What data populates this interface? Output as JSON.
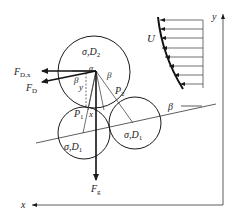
{
  "diagram": {
    "labels": {
      "top_particle": "σ,D",
      "top_particle_sub": "2",
      "bottom_left_particle": "σ,D",
      "bottom_left_particle_sub": "1",
      "bottom_right_particle": "σ,D",
      "bottom_right_particle_sub": "1",
      "drag_x": "F",
      "drag_x_sub": "D,x",
      "drag": "F",
      "drag_sub": "D",
      "gravity": "F",
      "gravity_sub": "g",
      "pivot_1": "P",
      "pivot_1_sub": "1",
      "pivot_2": "P",
      "pivot_2_sub": "2",
      "angle_beta_left": "β",
      "angle_beta_right": "β",
      "angle_beta_slope": "β",
      "angle_alpha": "α",
      "dist_x": "x",
      "dist_y": "y",
      "velocity": "U",
      "axis_x": "x",
      "axis_y": "y"
    },
    "colors": {
      "stroke": "#1a1a1a",
      "text": "#222222"
    }
  }
}
